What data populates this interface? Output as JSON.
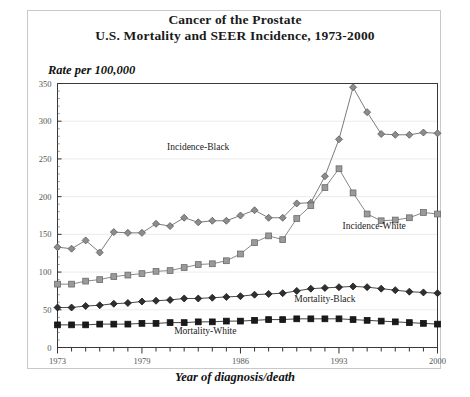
{
  "title": {
    "line1": "Cancer of the Prostate",
    "line2": "U.S. Mortality and SEER Incidence, 1973-2000"
  },
  "axes": {
    "y_title": "Rate per 100,000",
    "x_title": "Year of diagnosis/death"
  },
  "chart_data": {
    "type": "line",
    "xlabel": "Year of diagnosis/death",
    "ylabel": "Rate per 100,000",
    "xlim": [
      1973,
      2000
    ],
    "ylim": [
      0,
      350
    ],
    "yticks": [
      0,
      50,
      100,
      150,
      200,
      250,
      300,
      350
    ],
    "ytick_labels": [
      "0",
      "50",
      "100",
      "150",
      "200",
      "250",
      "300",
      "350"
    ],
    "xticks_labeled": [
      1973,
      1979,
      1986,
      1993,
      2000
    ],
    "xtick_labels": [
      "1973",
      "1979",
      "1986",
      "1993",
      "2000"
    ],
    "x_minor_ticks_every": 1,
    "grid": true,
    "grid_axis": "y",
    "legend": "inline-annotations",
    "x": [
      1973,
      1974,
      1975,
      1976,
      1977,
      1978,
      1979,
      1980,
      1981,
      1982,
      1983,
      1984,
      1985,
      1986,
      1987,
      1988,
      1989,
      1990,
      1991,
      1992,
      1993,
      1994,
      1995,
      1996,
      1997,
      1998,
      1999,
      2000
    ],
    "series": [
      {
        "name": "Incidence-Black",
        "marker": "diamond",
        "color": "#8c8c8c",
        "edge_color": "#5a5a5a",
        "label_x": 1983.0,
        "label_y": 262,
        "values": [
          133,
          131,
          142,
          126,
          153,
          152,
          152,
          164,
          161,
          172,
          166,
          168,
          168,
          175,
          182,
          172,
          172,
          191,
          192,
          227,
          276,
          345,
          312,
          283,
          282,
          282,
          285,
          284
        ]
      },
      {
        "name": "Incidence-White",
        "marker": "square",
        "color": "#9a9a9a",
        "edge_color": "#6a6a6a",
        "label_x": 1995.5,
        "label_y": 157,
        "values": [
          84,
          84,
          88,
          90,
          94,
          96,
          98,
          101,
          102,
          106,
          110,
          111,
          115,
          124,
          139,
          148,
          143,
          171,
          188,
          212,
          237,
          205,
          177,
          168,
          169,
          172,
          179,
          177
        ]
      },
      {
        "name": "Mortality-Black",
        "marker": "diamond",
        "color": "#2f2f2f",
        "edge_color": "#1a1a1a",
        "label_x": 1992.0,
        "label_y": 60,
        "values": [
          53,
          53,
          55,
          56,
          58,
          59,
          61,
          62,
          63,
          65,
          65,
          66,
          67,
          68,
          70,
          71,
          72,
          75,
          78,
          79,
          80,
          81,
          80,
          78,
          76,
          74,
          73,
          72
        ]
      },
      {
        "name": "Mortality-White",
        "marker": "square",
        "color": "#1a1a1a",
        "edge_color": "#111111",
        "label_x": 1983.5,
        "label_y": 18,
        "values": [
          30,
          30,
          30,
          31,
          31,
          31,
          32,
          32,
          33,
          33,
          34,
          34,
          35,
          35,
          36,
          37,
          37,
          38,
          38,
          38,
          38,
          37,
          36,
          35,
          34,
          33,
          32,
          31
        ]
      }
    ]
  }
}
